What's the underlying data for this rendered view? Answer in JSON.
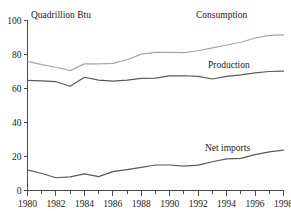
{
  "chart_data": {
    "type": "line",
    "title": "",
    "subtitle": "",
    "xlabel": "",
    "ylabel": "Quadrillion Btu",
    "ylim": [
      0,
      100
    ],
    "xlim": [
      1980,
      1998
    ],
    "grid": false,
    "legend_position": "inline-right",
    "y_ticks": [
      "0",
      "20",
      "40",
      "60",
      "80",
      "100"
    ],
    "y_tick_values": [
      0,
      20,
      40,
      60,
      80,
      100
    ],
    "x_ticks": [
      "1980",
      "1982",
      "1984",
      "1986",
      "1988",
      "1990",
      "1992",
      "1994",
      "1996",
      "1998"
    ],
    "x_tick_values": [
      1980,
      1982,
      1984,
      1986,
      1988,
      1990,
      1992,
      1994,
      1996,
      1998
    ],
    "x_minor_tick_values": [
      1981,
      1983,
      1985,
      1987,
      1989,
      1991,
      1993,
      1995,
      1997
    ],
    "x": [
      1980,
      1981,
      1982,
      1983,
      1984,
      1985,
      1986,
      1987,
      1988,
      1989,
      1990,
      1991,
      1992,
      1993,
      1994,
      1995,
      1996,
      1997,
      1998
    ],
    "series": [
      {
        "name": "Consumption",
        "color": "#a6a6a6",
        "values": [
          76.0,
          74.0,
          72.5,
          70.5,
          74.5,
          74.5,
          74.8,
          76.9,
          80.2,
          81.3,
          81.3,
          81.1,
          82.2,
          83.9,
          85.6,
          87.2,
          89.7,
          91.2,
          91.5
        ]
      },
      {
        "name": "Production",
        "color": "#595959",
        "values": [
          64.8,
          64.5,
          64.0,
          61.3,
          66.6,
          64.9,
          64.3,
          64.9,
          66.0,
          66.1,
          67.4,
          67.5,
          67.1,
          65.6,
          67.1,
          68.0,
          69.2,
          70.0,
          70.2
        ]
      },
      {
        "name": "Net imports",
        "color": "#595959",
        "values": [
          12.1,
          10.0,
          7.5,
          8.0,
          9.8,
          8.2,
          11.1,
          12.3,
          13.6,
          15.0,
          15.0,
          14.3,
          14.9,
          16.9,
          18.6,
          18.9,
          21.1,
          22.7,
          23.8
        ]
      }
    ],
    "annotations": [
      {
        "text": "Consumption",
        "for": "Consumption"
      },
      {
        "text": "Production",
        "for": "Production"
      },
      {
        "text": "Net imports",
        "for": "Net imports"
      }
    ]
  }
}
